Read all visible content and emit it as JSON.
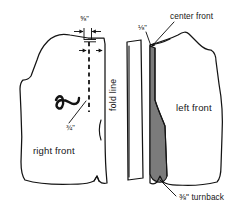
{
  "diagram": {
    "background_color": "#ffffff",
    "line_color": "#141414",
    "shade_color": "#7b7b7b"
  },
  "pieces": {
    "right_front": {
      "label": "right front"
    },
    "left_front": {
      "label": "left front"
    },
    "facing_strip": {
      "label": ""
    }
  },
  "labels": {
    "five_eighths": "⅝\"",
    "three_quarters": "¾\"",
    "one_eighth": "⅛\"",
    "fold_line": "fold line",
    "center_front": "center front",
    "turnback": "⅜\" turnback"
  }
}
